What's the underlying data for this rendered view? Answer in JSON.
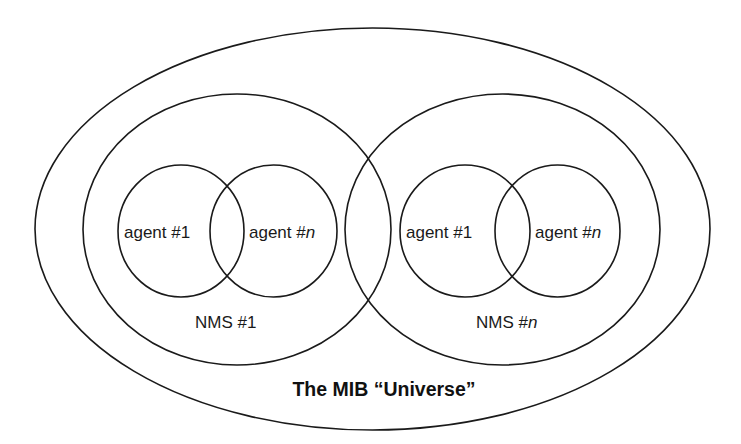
{
  "diagram": {
    "title": "The MIB “Universe”",
    "colors": {
      "stroke": "#1a1a1a",
      "text": "#1a1a1a",
      "background": "#ffffff"
    },
    "universe": {
      "label": "The MIB “Universe”"
    },
    "nms": [
      {
        "label_prefix": "NMS #",
        "label_suffix": "1",
        "agents": [
          {
            "label_prefix": "agent #",
            "label_suffix": "1"
          },
          {
            "label_prefix": "agent #",
            "label_suffix": "n"
          }
        ]
      },
      {
        "label_prefix": "NMS #",
        "label_suffix": "n",
        "agents": [
          {
            "label_prefix": "agent #",
            "label_suffix": "1"
          },
          {
            "label_prefix": "agent #",
            "label_suffix": "n"
          }
        ]
      }
    ]
  }
}
